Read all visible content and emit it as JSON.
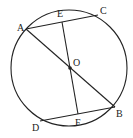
{
  "diagram": {
    "type": "circle-geometry",
    "circle": {
      "cx": 69,
      "cy": 68,
      "r": 58
    },
    "points": {
      "A": {
        "label": "A",
        "x": 26,
        "y": 29
      },
      "C": {
        "label": "C",
        "x": 98,
        "y": 15
      },
      "E": {
        "label": "E",
        "x": 62,
        "y": 22
      },
      "O": {
        "label": "O",
        "x": 70,
        "y": 68
      },
      "B": {
        "label": "B",
        "x": 115,
        "y": 107
      },
      "D": {
        "label": "D",
        "x": 40,
        "y": 121
      },
      "F": {
        "label": "F",
        "x": 78,
        "y": 114
      }
    },
    "segments": [
      [
        "A",
        "C"
      ],
      [
        "A",
        "B"
      ],
      [
        "D",
        "B"
      ],
      [
        "E",
        "F"
      ]
    ],
    "stroke_color": "#222222"
  }
}
